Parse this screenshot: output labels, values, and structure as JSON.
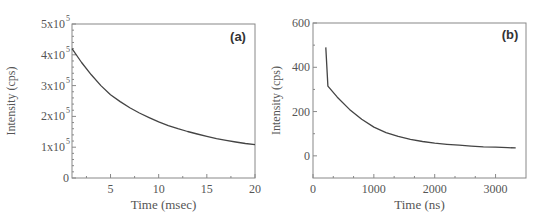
{
  "chart_data": [
    {
      "type": "line",
      "panel_label": "(a)",
      "title": "",
      "xlabel": "Time (msec)",
      "ylabel": "Intensity (cps)",
      "xlim": [
        1,
        20
      ],
      "ylim": [
        0,
        500000
      ],
      "xticks": [
        5,
        10,
        15,
        20
      ],
      "xtick_labels": [
        "5",
        "10",
        "15",
        "20"
      ],
      "yticks": [
        0,
        100000,
        200000,
        300000,
        400000,
        500000
      ],
      "ytick_labels": [
        "0",
        "1x10^5",
        "2x10^5",
        "3x10^5",
        "4x10^5",
        "5x10^5"
      ],
      "grid": false,
      "legend": null,
      "series": [
        {
          "name": "decay",
          "x": [
            1.0,
            2.0,
            3.0,
            4.0,
            5.0,
            6.0,
            7.0,
            8.0,
            9.0,
            10.0,
            11.0,
            12.0,
            13.0,
            14.0,
            15.0,
            16.0,
            17.0,
            18.0,
            19.0,
            20.0
          ],
          "y": [
            420000,
            375000,
            335000,
            300000,
            270000,
            248000,
            228000,
            211000,
            196000,
            182000,
            170000,
            160000,
            151000,
            143000,
            135000,
            128000,
            122000,
            117000,
            112000,
            108000
          ]
        }
      ]
    },
    {
      "type": "line",
      "panel_label": "(b)",
      "title": "",
      "xlabel": "Time (ns)",
      "ylabel": "Intensity (cps)",
      "xlim": [
        0,
        3500
      ],
      "ylim": [
        -100,
        600
      ],
      "xticks": [
        0,
        1000,
        2000,
        3000
      ],
      "xtick_labels": [
        "0",
        "1000",
        "2000",
        "3000"
      ],
      "yticks": [
        0,
        200,
        400,
        600
      ],
      "ytick_labels": [
        "0",
        "200",
        "400",
        "600"
      ],
      "grid": false,
      "legend": null,
      "series": [
        {
          "name": "decay",
          "x": [
            210,
            245,
            400,
            600,
            800,
            1000,
            1200,
            1400,
            1600,
            1800,
            2000,
            2200,
            2400,
            2600,
            2800,
            3000,
            3200,
            3330
          ],
          "y": [
            490,
            315,
            265,
            210,
            165,
            130,
            105,
            88,
            75,
            65,
            57,
            52,
            48,
            44,
            41,
            39,
            37,
            36
          ]
        }
      ]
    }
  ]
}
